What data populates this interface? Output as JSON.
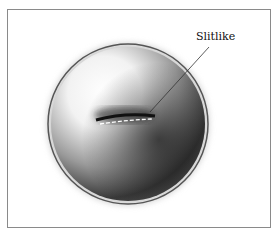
{
  "figure": {
    "label": "Slitlike"
  }
}
